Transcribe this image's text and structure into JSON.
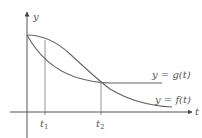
{
  "diagram": {
    "axes": {
      "x_label": "t",
      "y_label": "y"
    },
    "ticks": [
      {
        "name": "t",
        "sub": "1"
      },
      {
        "name": "t",
        "sub": "2"
      }
    ],
    "curves": [
      {
        "label": "y = g(t)",
        "description": "decreases quickly from start value, levels off horizontally after crossing at t2"
      },
      {
        "label": "y = f(t)",
        "description": "starts at same value, decreases slowly then faster, crosses g at t2 and ends lower"
      }
    ],
    "colors": {
      "axis": "#555555",
      "curve": "#666666",
      "text": "#555555"
    }
  }
}
